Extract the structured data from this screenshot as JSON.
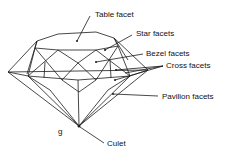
{
  "diagram": {
    "labels": {
      "table": "Table facet",
      "star": "Star facets",
      "bezel": "Bezel facets",
      "cross": "Cross facets",
      "pavilion": "Pavilion facets",
      "culet": "Culet",
      "figure_letter": "g"
    },
    "colors": {
      "line": "#1a1a1a",
      "background": "#ffffff"
    }
  }
}
